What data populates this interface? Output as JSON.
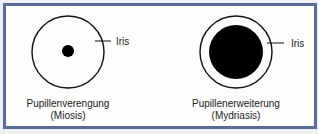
{
  "diagram": {
    "left": {
      "title": "Pupillenverengung",
      "subtitle": "(Miosis)",
      "iris_label": "Iris",
      "pupil_size": "small"
    },
    "right": {
      "title": "Pupillenerweiterung",
      "subtitle": "(Mydriasis)",
      "iris_label": "Iris",
      "pupil_size": "large"
    },
    "colors": {
      "border": "#5a6d98",
      "background": "#fdfdfb",
      "pupil": "#000000",
      "outline": "#111111"
    }
  }
}
